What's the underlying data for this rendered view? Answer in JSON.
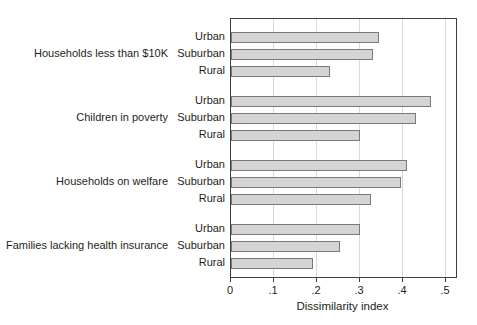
{
  "chart_data": {
    "type": "bar",
    "orientation": "horizontal",
    "title": "",
    "xlabel": "Dissimilarity index",
    "ylabel": "",
    "groups": [
      "Households less than $10K",
      "Children in poverty",
      "Households on welfare",
      "Families lacking health insurance"
    ],
    "series_per_group": [
      "Urban",
      "Suburban",
      "Rural"
    ],
    "values": [
      [
        0.345,
        0.33,
        0.23
      ],
      [
        0.465,
        0.43,
        0.3
      ],
      [
        0.41,
        0.395,
        0.325
      ],
      [
        0.3,
        0.253,
        0.19
      ]
    ],
    "x_ticks": [
      "0",
      ".1",
      ".2",
      ".3",
      ".4",
      ".5"
    ],
    "x_tick_values": [
      0,
      0.1,
      0.2,
      0.3,
      0.4,
      0.5
    ],
    "xlim": [
      0,
      0.528
    ],
    "grid": "vertical",
    "legend": "none",
    "colors": {
      "bar_fill": "#d4d4d4",
      "bar_border": "#7a7a7a",
      "gridline": "#d9d9d9",
      "frame": "#3f3f3f",
      "text": "#231f20",
      "background": "#ffffff"
    }
  }
}
